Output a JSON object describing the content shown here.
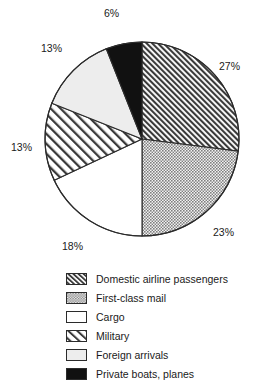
{
  "chart_data": {
    "type": "pie",
    "title": "",
    "subtitle": "",
    "xlabel": "",
    "ylabel": "",
    "legend_position": "bottom",
    "grid": false,
    "units": "percent",
    "total": 100,
    "categories": [
      "Domestic airline passengers",
      "First-class mail",
      "Cargo",
      "Military",
      "Foreign arrivals",
      "Private boats, planes"
    ],
    "values": [
      27,
      23,
      18,
      13,
      13,
      6
    ],
    "data_labels": [
      "27%",
      "23%",
      "18%",
      "13%",
      "13%",
      "6%"
    ],
    "start_angle_deg": 0,
    "direction": "clockwise",
    "slices": [
      {
        "label": "Domestic airline passengers",
        "value": 27,
        "data_label": "27%",
        "pattern": "dense-diagonal-hatch",
        "fill": "#ffffff",
        "line_color": "#2b2b2b"
      },
      {
        "label": "First-class mail",
        "value": 23,
        "data_label": "23%",
        "pattern": "gray-checker",
        "fill": "#9a9a9a",
        "line_color": "#2b2b2b"
      },
      {
        "label": "Cargo",
        "value": 18,
        "data_label": "18%",
        "pattern": "solid-white",
        "fill": "#ffffff",
        "line_color": "#2b2b2b"
      },
      {
        "label": "Military",
        "value": 13,
        "data_label": "13%",
        "pattern": "wide-diagonal-hatch",
        "fill": "#ffffff",
        "line_color": "#2b2b2b"
      },
      {
        "label": "Foreign arrivals",
        "value": 13,
        "data_label": "13%",
        "pattern": "very-light-gray",
        "fill": "#ededed",
        "line_color": "#2b2b2b"
      },
      {
        "label": "Private boats, planes",
        "value": 6,
        "data_label": "6%",
        "pattern": "solid-black",
        "fill": "#111111",
        "line_color": "#2b2b2b"
      }
    ]
  },
  "labels": {
    "domestic": "27%",
    "mail": "23%",
    "cargo": "18%",
    "military": "13%",
    "foreign": "13%",
    "private": "6%"
  },
  "legend": {
    "items": [
      {
        "label": "Domestic airline passengers",
        "swatch": "dense-diagonal-hatch-swatch"
      },
      {
        "label": "First-class mail",
        "swatch": "gray-checker-swatch"
      },
      {
        "label": "Cargo",
        "swatch": "solid-white-swatch"
      },
      {
        "label": "Military",
        "swatch": "wide-diagonal-hatch-swatch"
      },
      {
        "label": "Foreign arrivals",
        "swatch": "very-light-gray-swatch"
      },
      {
        "label": "Private boats, planes",
        "swatch": "solid-black-swatch"
      }
    ]
  }
}
